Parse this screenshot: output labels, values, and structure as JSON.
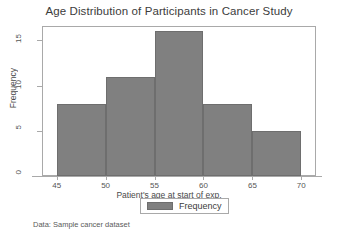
{
  "chart_data": {
    "type": "bar",
    "title": "Age Distribution of Participants in Cancer Study",
    "xlabel": "Patient's age at start of exp.",
    "ylabel": "Frequency",
    "categories": [
      "45-50",
      "50-55",
      "55-60",
      "60-65",
      "65-70"
    ],
    "bin_edges": [
      45,
      50,
      55,
      60,
      65,
      70
    ],
    "values": [
      8,
      11,
      16,
      8,
      5
    ],
    "series": [
      {
        "name": "Frequency",
        "values": [
          8,
          11,
          16,
          8,
          5
        ],
        "color": "#808080"
      }
    ],
    "xlim": [
      43.5,
      71.5
    ],
    "ylim": [
      0,
      16.6
    ],
    "x_ticks": [
      45,
      50,
      55,
      60,
      65,
      70
    ],
    "y_ticks": [
      0,
      5,
      10,
      15
    ],
    "x_tick_labels": [
      "45",
      "50",
      "55",
      "60",
      "65",
      "70"
    ],
    "y_tick_labels": [
      "0",
      "5",
      "10",
      "15"
    ],
    "grid": false,
    "legend_position": "below-axis-center",
    "legend_entries": [
      "Frequency"
    ],
    "annotations": [
      "Data:  Sample cancer dataset"
    ]
  },
  "chart": {
    "title": "Age Distribution of Participants in Cancer Study",
    "x_axis_title": "Patient's age at start of exp.",
    "y_axis_title": "Frequency",
    "footnote": "Data:  Sample cancer dataset"
  },
  "legend": {
    "label": "Frequency"
  },
  "colors": {
    "bar_fill": "#808080",
    "bar_edge": "#6e6e6e",
    "axis": "#a9a9a9",
    "text": "#3c3c3c",
    "background": "#ffffff"
  }
}
